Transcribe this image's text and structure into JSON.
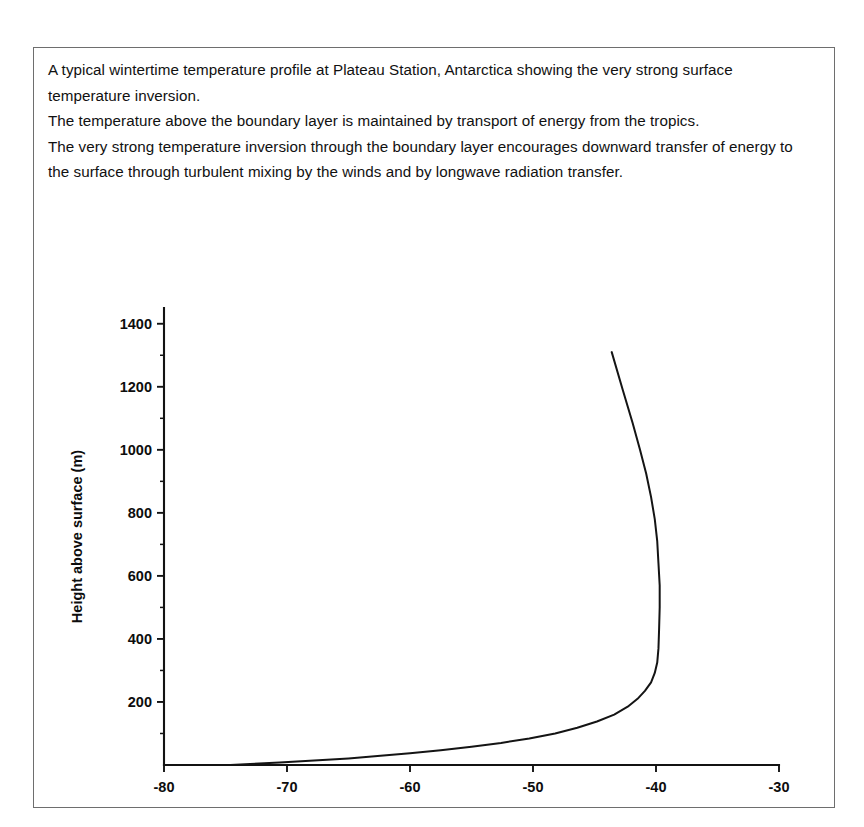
{
  "caption": {
    "lines": [
      "A typical wintertime temperature profile at Plateau Station, Antarctica showing the very strong surface temperature inversion.",
      "The temperature above the boundary layer is maintained by transport of energy from the tropics.",
      "The very strong temperature inversion through the boundary layer encourages downward transfer of energy to the surface through turbulent mixing by the winds and by longwave radiation transfer."
    ]
  },
  "chart_data": {
    "type": "line",
    "title": "",
    "xlabel": "Temperature (°C)",
    "ylabel": "Height above surface (m)",
    "xlim": [
      -80,
      -30
    ],
    "ylim": [
      0,
      1450
    ],
    "xticks": [
      -80,
      -70,
      -60,
      -50,
      -40,
      -30
    ],
    "xtick_labels": [
      "-80",
      "-70",
      "-60",
      "-50",
      "-40",
      "-30"
    ],
    "yticks": [
      200,
      400,
      600,
      800,
      1000,
      1200,
      1400
    ],
    "ytick_labels": [
      "200",
      "400",
      "600",
      "800",
      "1000",
      "1200",
      "1400"
    ],
    "yticks_minor": [
      100,
      300,
      500,
      700,
      900,
      1100,
      1300
    ],
    "grid": false,
    "legend": null,
    "series": [
      {
        "name": "Temperature profile",
        "x": [
          -74.6,
          -73.0,
          -70.6,
          -67.8,
          -65.0,
          -62.4,
          -60.0,
          -57.5,
          -55.0,
          -52.6,
          -50.3,
          -48.2,
          -46.4,
          -44.8,
          -43.4,
          -42.3,
          -41.5,
          -40.9,
          -40.4,
          -40.1,
          -39.9,
          -39.8,
          -39.75,
          -39.7,
          -39.7,
          -39.8,
          -39.9,
          -40.1,
          -40.4,
          -40.8,
          -41.3,
          -41.9,
          -42.7,
          -43.6
        ],
        "y": [
          0,
          3,
          8,
          14,
          21,
          29,
          37,
          47,
          58,
          70,
          84,
          100,
          118,
          138,
          160,
          185,
          210,
          235,
          262,
          292,
          325,
          370,
          430,
          500,
          570,
          640,
          710,
          780,
          850,
          925,
          1000,
          1085,
          1190,
          1310
        ]
      }
    ],
    "annotations": []
  }
}
